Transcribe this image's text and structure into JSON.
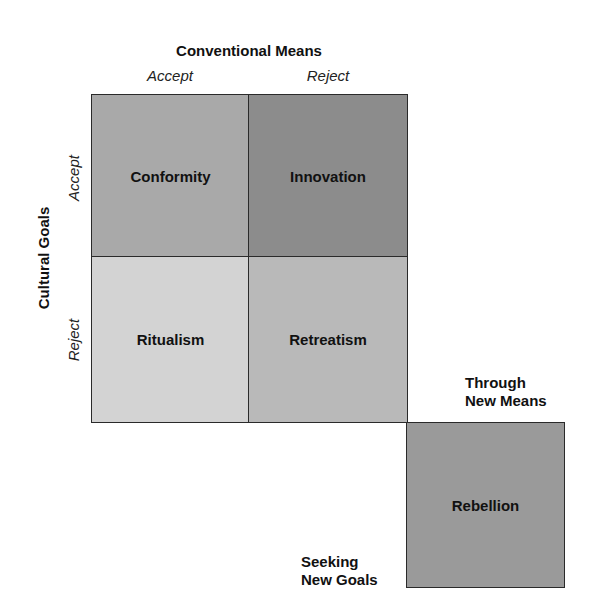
{
  "diagram": {
    "type": "typology-matrix",
    "column_header": "Conventional Means",
    "column_labels": [
      "Accept",
      "Reject"
    ],
    "row_header": "Cultural Goals",
    "row_labels": [
      "Accept",
      "Reject"
    ],
    "cells": [
      {
        "label": "Conformity",
        "row": "Accept",
        "col": "Accept",
        "color": "#a9a9a9"
      },
      {
        "label": "Innovation",
        "row": "Accept",
        "col": "Reject",
        "color": "#8c8c8c"
      },
      {
        "label": "Ritualism",
        "row": "Reject",
        "col": "Accept",
        "color": "#d3d3d3"
      },
      {
        "label": "Retreatism",
        "row": "Reject",
        "col": "Reject",
        "color": "#b9b9b9"
      }
    ],
    "extra_cell": {
      "label": "Rebellion",
      "color": "#9a9a9a",
      "top_label_line1": "Through",
      "top_label_line2": "New Means",
      "left_label_line1": "Seeking",
      "left_label_line2": "New Goals"
    }
  }
}
